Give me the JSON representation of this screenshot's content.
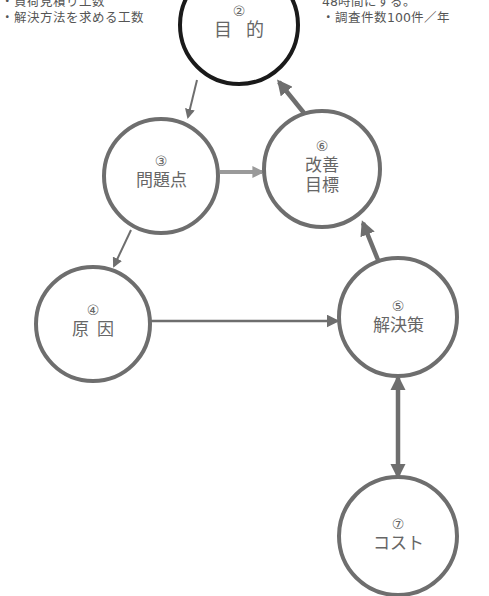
{
  "notes": {
    "left": [
      "・負荷見積り工数",
      "・解決方法を求める工数"
    ],
    "right": [
      "48時間にする。",
      "・調査件数100件／年"
    ]
  },
  "nodes": [
    {
      "id": "goal",
      "number": "②",
      "label": "目的",
      "cx": 239,
      "cy": 25,
      "r": 59,
      "stroke": "#1a1a1a"
    },
    {
      "id": "problem",
      "number": "③",
      "label": "問題点",
      "cx": 161,
      "cy": 176,
      "r": 57,
      "stroke": "#6e6e6e"
    },
    {
      "id": "cause",
      "number": "④",
      "label": "原因",
      "cx": 93,
      "cy": 324,
      "r": 57,
      "stroke": "#6e6e6e"
    },
    {
      "id": "solution",
      "number": "⑤",
      "label": "解決策",
      "cx": 398,
      "cy": 317,
      "r": 59,
      "stroke": "#6e6e6e"
    },
    {
      "id": "target",
      "number": "⑥",
      "label": "改善目標",
      "label_lines": [
        "改善",
        "目標"
      ],
      "cx": 322,
      "cy": 169,
      "r": 58,
      "stroke": "#6e6e6e"
    },
    {
      "id": "cost",
      "number": "⑦",
      "label": "コスト",
      "cx": 398,
      "cy": 536,
      "r": 59,
      "stroke": "#6e6e6e"
    }
  ],
  "edges": [
    {
      "from": "goal",
      "to": "problem",
      "style": "thin"
    },
    {
      "from": "problem",
      "to": "cause",
      "style": "thin"
    },
    {
      "from": "problem",
      "to": "target",
      "style": "light-thick"
    },
    {
      "from": "cause",
      "to": "solution",
      "style": "medium"
    },
    {
      "from": "solution",
      "to": "target",
      "style": "thick"
    },
    {
      "from": "target",
      "to": "goal",
      "style": "thick"
    },
    {
      "from": "solution",
      "to": "cost",
      "style": "thick-bidirectional"
    }
  ],
  "colors": {
    "goal_stroke": "#1a1a1a",
    "node_stroke": "#6e6e6e",
    "arrow": "#6e6e6e",
    "arrow_light": "#9a9a9a",
    "text": "#666666"
  }
}
